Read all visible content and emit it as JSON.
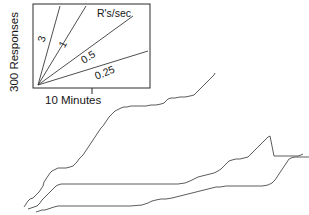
{
  "figure": {
    "type": "cumulative-record",
    "width": 309,
    "height": 215,
    "background": "#ffffff",
    "ink_color": "#333333"
  },
  "axis_labels": {
    "y_label": "300 Responses",
    "x_label": "10 Minutes"
  },
  "inset_legend": {
    "title": "R's/sec",
    "frame": {
      "x": 33,
      "y": 4,
      "width": 117,
      "height": 84
    },
    "origin": {
      "x": 38,
      "y": 85
    },
    "tick_x": 92,
    "slopes": [
      {
        "label": "3",
        "value": 3,
        "end_x": 60,
        "end_y": 6,
        "label_x": 45,
        "label_y": 40,
        "label_rotate": -73
      },
      {
        "label": "1",
        "value": 1,
        "end_x": 86,
        "end_y": 6,
        "label_x": 66,
        "label_y": 46,
        "label_rotate": -61
      },
      {
        "label": "0.5",
        "value": 0.5,
        "end_x": 133,
        "end_y": 16,
        "label_x": 90,
        "label_y": 60,
        "label_rotate": -32
      },
      {
        "label": "0.25",
        "value": 0.25,
        "end_x": 148,
        "end_y": 51,
        "label_x": 106,
        "label_y": 76,
        "label_rotate": -22
      }
    ]
  },
  "chart_data": {
    "type": "line",
    "title": "",
    "xlabel": "10 Minutes",
    "ylabel": "300 Responses",
    "legend_title": "R's/sec",
    "legend_entries": [
      "3",
      "1",
      "0.5",
      "0.25"
    ],
    "grid": false,
    "xlim": [
      0,
      309
    ],
    "ylim": [
      0,
      215
    ],
    "note": "Three cumulative response records; x = time, y = cumulative responses. Points are pixel traces of each stepped staircase curve.",
    "series": [
      {
        "name": "record-1",
        "points": "24,207 26,204 28,201 30,199 33,198 35,196 37,194 39,192 41,189 43,186 44,182 46,179 48,176 50,173 52,171 54,170 56,169 58,168 62,168 66,168 70,167 73,166 75,164 77,162 79,159 81,157 83,155 85,152 87,149 89,146 91,143 93,140 95,137 97,134 99,131 101,128 103,126 105,123 107,120 109,117 111,115 113,113 115,111 117,110 119,109 121,108 124,107 127,107 131,106 136,106 141,106 146,106 151,105 156,105 161,104 164,103 166,101 168,99 171,98 175,98 180,97 185,97 190,96 194,95 196,93 198,91 200,89 202,87 204,85 206,83 208,81 210,79 212,77 214,75 215,73"
      },
      {
        "name": "record-2",
        "points": "28,209 31,208 34,207 37,206 40,203 42,200 44,198 46,196 48,194 50,192 52,190 54,188 56,186 58,185 61,184 65,184 70,184 78,184 90,184 105,184 120,184 135,184 150,184 165,184 178,184 185,183 190,181 194,179 198,177 202,176 206,175 210,174 214,173 218,171 221,169 223,167 225,165 227,163 229,161 232,160 236,159 240,159 244,158 248,157 250,155 252,153 254,151 256,149 258,147 260,145 262,143 264,141 266,139 268,137 270,136 274,156 277,156 281,156 286,156 290,156 294,156 298,156 301,155 303,154"
      },
      {
        "name": "record-3",
        "points": "36,212 39,211 42,210 45,210 48,209 51,208 54,207 58,206 63,206 70,206 80,206 92,206 105,206 118,206 130,206 142,205 148,203 152,201 156,200 161,199 166,199 172,198 176,197 180,196 184,195 188,194 192,193 196,192 200,191 204,190 208,189 212,188 216,187 220,187 226,186 232,186 238,186 244,186 250,186 256,186 262,186 268,185 272,183 275,180 277,177 279,174 281,171 283,168 285,165 287,162 289,159 291,158 295,157 300,157 305,157 309,157"
      }
    ]
  }
}
